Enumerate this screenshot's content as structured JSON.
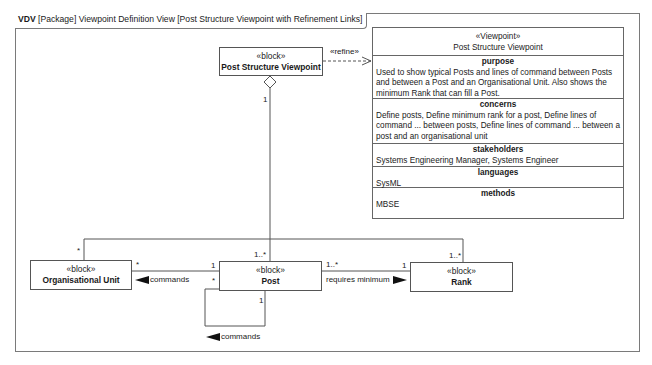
{
  "frame": {
    "kind": "VDV",
    "title": "[Package] Viewpoint Definition View [Post Structure Viewpoint with Refinement Links]"
  },
  "blocks": {
    "post_structure_viewpoint": {
      "stereotype": "«block»",
      "name": "Post Structure Viewpoint"
    },
    "organisational_unit": {
      "stereotype": "«block»",
      "name": "Organisational Unit"
    },
    "post": {
      "stereotype": "«block»",
      "name": "Post"
    },
    "rank": {
      "stereotype": "«block»",
      "name": "Rank"
    }
  },
  "viewpoint": {
    "stereotype": "«Viewpoint»",
    "name": "Post Structure Viewpoint",
    "compartments": [
      {
        "title": "purpose",
        "text": "Used to show typical Posts and lines of command between Posts and between a Post and an Organisational Unit. Also shows the minimum Rank that can fill a Post."
      },
      {
        "title": "concerns",
        "text": "Define posts, Define minimum rank for a post, Define lines of command ... between posts, Define lines of command ... between a post and an organisational unit"
      },
      {
        "title": "stakeholders",
        "text": "Systems Engineering Manager, Systems Engineer"
      },
      {
        "title": "languages",
        "text": "SysML"
      },
      {
        "title": "methods",
        "text": "MBSE"
      }
    ]
  },
  "relationships": {
    "refine": {
      "label": "«refine»"
    },
    "composition": {
      "whole_mult": "1"
    },
    "psv_to_orgunit_mult": "*",
    "psv_to_post_mult": "1..*",
    "psv_to_rank_mult": "1..*",
    "orgunit_commands": {
      "label": "commands",
      "orgunit_mult": "*",
      "post_mult": "1"
    },
    "post_self_commands": {
      "label": "commands",
      "source_mult": "*",
      "target_mult": "1"
    },
    "requires_minimum": {
      "label": "requires minimum",
      "post_mult": "1..*",
      "rank_mult": "1"
    }
  },
  "colors": {
    "line": "#555555",
    "frame": "#7a7a7a",
    "background": "#ffffff"
  }
}
